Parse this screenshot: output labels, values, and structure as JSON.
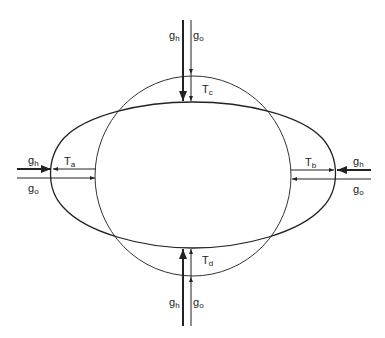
{
  "diagram": {
    "shapes": {
      "circle": {
        "cx": 193,
        "cy": 176,
        "rx": 98,
        "ry": 100
      },
      "ellipse": {
        "left": 51,
        "right": 336,
        "top": 102,
        "bottom": 248
      }
    },
    "labels": {
      "top_gh": {
        "base": "g",
        "sub": "h"
      },
      "top_go": {
        "base": "g",
        "sub": "o"
      },
      "top_T": {
        "base": "T",
        "sub": "c"
      },
      "left_gh": {
        "base": "g",
        "sub": "h"
      },
      "left_go": {
        "base": "g",
        "sub": "o"
      },
      "left_T": {
        "base": "T",
        "sub": "a"
      },
      "right_gh": {
        "base": "g",
        "sub": "h"
      },
      "right_go": {
        "base": "g",
        "sub": "o"
      },
      "right_T": {
        "base": "T",
        "sub": "b"
      },
      "bottom_gh": {
        "base": "g",
        "sub": "h"
      },
      "bottom_go": {
        "base": "g",
        "sub": "o"
      },
      "bottom_T": {
        "base": "T",
        "sub": "d"
      }
    },
    "colors": {
      "stroke": "#222222",
      "background": "#ffffff"
    }
  }
}
